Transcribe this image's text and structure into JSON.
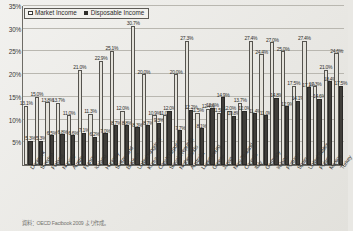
{
  "legend": {
    "position": "top-left",
    "entries": [
      {
        "label": "Market Income",
        "swatch": "market",
        "color": "#ffffff"
      },
      {
        "label": "Disposable Income",
        "swatch": "disp",
        "color": "#2e2d2a"
      }
    ]
  },
  "source_note": "資料：OECD Factbook 2009 より作成。",
  "chart_data": {
    "type": "bar",
    "title": "",
    "subtitle": "",
    "xlabel": "",
    "ylabel": "",
    "ylim": [
      0,
      35
    ],
    "ytick_labels": [
      "5%",
      "10%",
      "15%",
      "20%",
      "25%",
      "30%",
      "35%"
    ],
    "yticks": [
      5,
      10,
      15,
      20,
      25,
      30,
      35
    ],
    "grid": true,
    "value_labels": true,
    "categories": [
      "Denmark",
      "Sweden",
      "Finland",
      "Norway",
      "Austria",
      "France",
      "Iceland",
      "Hungary",
      "Switzerland",
      "Belgium",
      "United Kingdom",
      "Korea",
      "Czech Republic",
      "Slovak Republic",
      "Netherlands",
      "Australia",
      "Luxembourg",
      "Greece",
      "Japan",
      "New Zealand",
      "Canada",
      "Italy",
      "Germany",
      "Ireland",
      "Portugal",
      "Spain",
      "United States",
      "Poland",
      "Mexico",
      "Turkey"
    ],
    "series": [
      {
        "name": "Market Income",
        "color": "#e4e2db",
        "values": [
          13.1,
          15.0,
          13.8,
          13.7,
          11.0,
          21.0,
          11.3,
          22.9,
          25.1,
          12.0,
          30.7,
          20.0,
          10.9,
          11.0,
          20.0,
          27.3,
          11.5,
          12.4,
          11.5,
          12.0,
          13.7,
          27.4,
          24.4,
          27.0,
          25.0,
          17.5,
          27.4,
          17.3,
          21.0,
          24.6
        ]
      },
      {
        "name": "Disposable Income",
        "color": "#403e3a",
        "values": [
          5.3,
          5.3,
          6.5,
          6.8,
          6.6,
          7.1,
          6.2,
          7.0,
          8.7,
          8.8,
          8.3,
          8.7,
          9.3,
          12.0,
          7.7,
          12.2,
          8.1,
          12.6,
          14.9,
          10.8,
          12.0,
          11.4,
          11.0,
          14.8,
          12.9,
          14.1,
          17.1,
          14.6,
          18.4,
          17.5
        ]
      }
    ],
    "max_labeled_value": 30.7,
    "notable_labels": [
      "13.1%",
      "15.0%",
      "13.8%",
      "13.7%",
      "21.0%",
      "22.9%",
      "25.1%",
      "30.7%",
      "20.0%",
      "27.3%",
      "27.4%",
      "24.4%",
      "27.0%",
      "25.0%",
      "17.5%",
      "27.4%",
      "17.3%",
      "24.6%",
      "22.2%",
      "21.5%",
      "20.9%",
      "24.0%",
      "6.2%",
      "12.0%",
      "13.7%",
      "11.3%",
      "12.4%",
      "11.5%"
    ]
  }
}
